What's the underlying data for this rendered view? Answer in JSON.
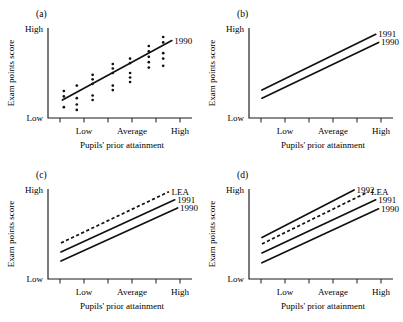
{
  "figure": {
    "background": "#ffffff",
    "ink": "#111111",
    "panel_count": 4
  },
  "axes": {
    "y_label": "Exam points score",
    "y_high": "High",
    "y_low": "Low",
    "x_label": "Pupils' prior attainment",
    "x_ticks": [
      "",
      "Low",
      "",
      "Average",
      "",
      "High"
    ],
    "x_tick_count": 6
  },
  "chart_data": [
    {
      "type": "scatter",
      "panel": "(a)",
      "title": "",
      "xlabel": "Pupils' prior attainment",
      "ylabel": "Exam points score",
      "xlim": [
        0,
        1
      ],
      "ylim": [
        0,
        1
      ],
      "grid": false,
      "legend_position": "line-end-right",
      "x_tick_labels": [
        "Low",
        "Average",
        "High"
      ],
      "y_tick_labels": [
        "Low",
        "High"
      ],
      "series": [
        {
          "name": "1990",
          "style": "solid",
          "label": "1990",
          "line": {
            "x0": 0.1,
            "y0": 0.2,
            "x1": 0.86,
            "y1": 0.86
          }
        }
      ],
      "points": [
        {
          "x": 0.11,
          "y": 0.3
        },
        {
          "x": 0.11,
          "y": 0.24
        },
        {
          "x": 0.11,
          "y": 0.12
        },
        {
          "x": 0.2,
          "y": 0.36
        },
        {
          "x": 0.2,
          "y": 0.22
        },
        {
          "x": 0.2,
          "y": 0.15
        },
        {
          "x": 0.2,
          "y": 0.09
        },
        {
          "x": 0.31,
          "y": 0.48
        },
        {
          "x": 0.31,
          "y": 0.43
        },
        {
          "x": 0.31,
          "y": 0.38
        },
        {
          "x": 0.31,
          "y": 0.25
        },
        {
          "x": 0.31,
          "y": 0.2
        },
        {
          "x": 0.45,
          "y": 0.6
        },
        {
          "x": 0.45,
          "y": 0.55
        },
        {
          "x": 0.45,
          "y": 0.5
        },
        {
          "x": 0.45,
          "y": 0.36
        },
        {
          "x": 0.45,
          "y": 0.31
        },
        {
          "x": 0.57,
          "y": 0.66
        },
        {
          "x": 0.57,
          "y": 0.61
        },
        {
          "x": 0.57,
          "y": 0.5
        },
        {
          "x": 0.57,
          "y": 0.45
        },
        {
          "x": 0.57,
          "y": 0.4
        },
        {
          "x": 0.7,
          "y": 0.8
        },
        {
          "x": 0.7,
          "y": 0.74
        },
        {
          "x": 0.7,
          "y": 0.68
        },
        {
          "x": 0.7,
          "y": 0.62
        },
        {
          "x": 0.7,
          "y": 0.56
        },
        {
          "x": 0.8,
          "y": 0.9
        },
        {
          "x": 0.8,
          "y": 0.84
        },
        {
          "x": 0.8,
          "y": 0.72
        },
        {
          "x": 0.8,
          "y": 0.66
        },
        {
          "x": 0.8,
          "y": 0.58
        }
      ]
    },
    {
      "type": "line",
      "panel": "(b)",
      "title": "",
      "xlabel": "Pupils' prior attainment",
      "ylabel": "Exam points score",
      "xlim": [
        0,
        1
      ],
      "ylim": [
        0,
        1
      ],
      "grid": false,
      "legend_position": "line-end-right",
      "x_tick_labels": [
        "Low",
        "Average",
        "High"
      ],
      "y_tick_labels": [
        "Low",
        "High"
      ],
      "series": [
        {
          "name": "1991",
          "style": "solid",
          "label": "1991",
          "line": {
            "x0": 0.09,
            "y0": 0.31,
            "x1": 0.88,
            "y1": 0.93
          }
        },
        {
          "name": "1990",
          "style": "solid",
          "label": "1990",
          "line": {
            "x0": 0.09,
            "y0": 0.22,
            "x1": 0.9,
            "y1": 0.84
          }
        }
      ],
      "points": []
    },
    {
      "type": "line",
      "panel": "(c)",
      "title": "",
      "xlabel": "Pupils' prior attainment",
      "ylabel": "Exam points score",
      "xlim": [
        0,
        1
      ],
      "ylim": [
        0,
        1
      ],
      "grid": false,
      "legend_position": "line-end-right",
      "x_tick_labels": [
        "Low",
        "Average",
        "High"
      ],
      "y_tick_labels": [
        "Low",
        "High"
      ],
      "series": [
        {
          "name": "LEA",
          "style": "dashed",
          "label": "LEA",
          "line": {
            "x0": 0.09,
            "y0": 0.4,
            "x1": 0.84,
            "y1": 0.97
          }
        },
        {
          "name": "1991",
          "style": "solid",
          "label": "1991",
          "line": {
            "x0": 0.09,
            "y0": 0.3,
            "x1": 0.88,
            "y1": 0.88
          }
        },
        {
          "name": "1990",
          "style": "solid",
          "label": "1990",
          "line": {
            "x0": 0.09,
            "y0": 0.2,
            "x1": 0.9,
            "y1": 0.79
          }
        }
      ],
      "points": []
    },
    {
      "type": "line",
      "panel": "(d)",
      "title": "",
      "xlabel": "Pupils' prior attainment",
      "ylabel": "Exam points score",
      "xlim": [
        0,
        1
      ],
      "ylim": [
        0,
        1
      ],
      "grid": false,
      "legend_position": "line-end-right",
      "x_tick_labels": [
        "Low",
        "Average",
        "High"
      ],
      "y_tick_labels": [
        "Low",
        "High"
      ],
      "series": [
        {
          "name": "1992",
          "style": "solid",
          "label": "1992",
          "line": {
            "x0": 0.09,
            "y0": 0.46,
            "x1": 0.73,
            "y1": 0.99
          }
        },
        {
          "name": "LEA",
          "style": "dashed",
          "label": "LEA",
          "line": {
            "x0": 0.09,
            "y0": 0.39,
            "x1": 0.83,
            "y1": 0.97
          }
        },
        {
          "name": "1991",
          "style": "solid",
          "label": "1991",
          "line": {
            "x0": 0.09,
            "y0": 0.29,
            "x1": 0.88,
            "y1": 0.88
          }
        },
        {
          "name": "1990",
          "style": "solid",
          "label": "1990",
          "line": {
            "x0": 0.09,
            "y0": 0.18,
            "x1": 0.9,
            "y1": 0.78
          }
        }
      ],
      "points": []
    }
  ]
}
